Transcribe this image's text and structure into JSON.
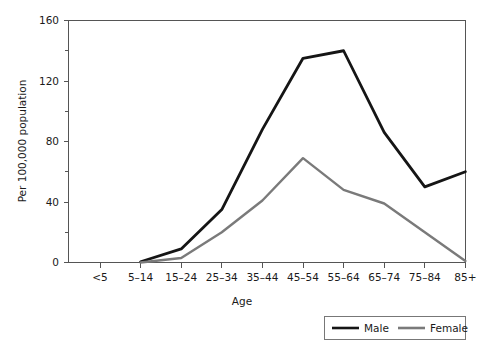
{
  "chart_data": {
    "type": "line",
    "title": "",
    "xlabel": "Age",
    "ylabel": "Per 100,000 population",
    "categories": [
      "<5",
      "5–14",
      "15–24",
      "25–34",
      "35–44",
      "45–54",
      "55–64",
      "65–74",
      "75–84",
      "85+"
    ],
    "series": [
      {
        "name": "Male",
        "color": "#151515",
        "values": [
          null,
          0.5,
          9,
          35,
          88,
          135,
          140,
          86,
          50,
          60
        ]
      },
      {
        "name": "Female",
        "color": "#7a7a7a",
        "values": [
          null,
          0,
          3,
          20,
          41,
          69,
          48,
          39,
          20,
          1
        ]
      }
    ],
    "ylim": [
      0,
      160
    ],
    "y_ticks": [
      0,
      40,
      80,
      120,
      160
    ],
    "y_minor_ticks": [
      20,
      60,
      100,
      140
    ],
    "y_tick_labels": [
      "0",
      "40",
      "80",
      "120",
      "160"
    ],
    "grid": false,
    "legend_position": "bottom-right",
    "legend_entries": [
      "Male",
      "Female"
    ]
  },
  "axes": {
    "x_title": "Age",
    "y_title": "Per 100,000 population"
  },
  "legend": {
    "male_label": "Male",
    "female_label": "Female"
  }
}
